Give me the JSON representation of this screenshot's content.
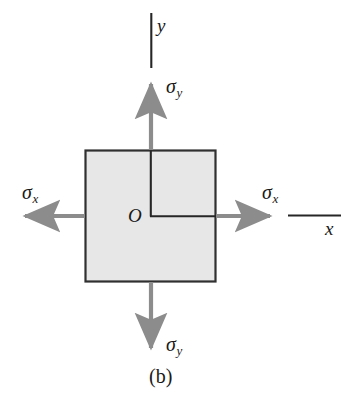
{
  "figure": {
    "caption": "(b)",
    "type": "stress-element-diagram"
  },
  "axes": {
    "y_label": "y",
    "x_label": "x",
    "origin_label": "O"
  },
  "stresses": [
    {
      "name": "sigma-y-top",
      "symbol": "σ",
      "subscript": "y",
      "direction": "up"
    },
    {
      "name": "sigma-y-bottom",
      "symbol": "σ",
      "subscript": "y",
      "direction": "down"
    },
    {
      "name": "sigma-x-left",
      "symbol": "σ",
      "subscript": "x",
      "direction": "left"
    },
    {
      "name": "sigma-x-right",
      "symbol": "σ",
      "subscript": "x",
      "direction": "right"
    }
  ],
  "colors": {
    "element_fill": "#e7e7e7",
    "element_stroke": "#303030",
    "arrow": "#8c8c8c",
    "axis_line": "#262626",
    "text": "#1a1a1a",
    "background": "#ffffff"
  },
  "geometry": {
    "element_left": 85,
    "element_top": 150,
    "element_width": 131,
    "element_height": 132,
    "center_x": 150,
    "center_y": 216
  }
}
